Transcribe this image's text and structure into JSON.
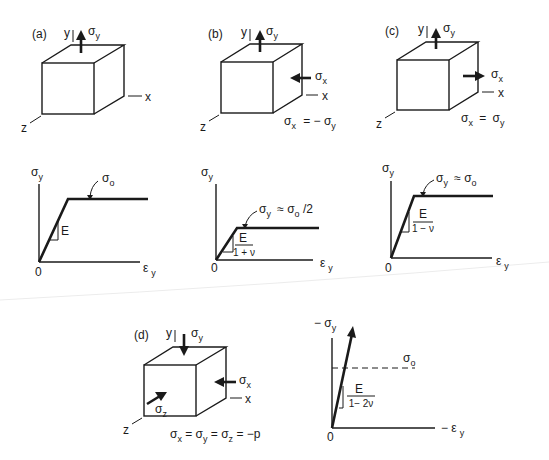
{
  "panels": {
    "a": {
      "label": "(a)",
      "axis_y": "y",
      "axis_x": "x",
      "axis_z": "z",
      "stress_y": "σ",
      "stress_y_sub": "y",
      "graph": {
        "y_axis": "σ",
        "y_axis_sub": "y",
        "x_axis": "ε",
        "x_axis_sub": "y",
        "origin": "0",
        "slope": "E",
        "plateau": "σ",
        "plateau_sub": "o"
      }
    },
    "b": {
      "label": "(b)",
      "axis_y": "y",
      "axis_x": "x",
      "axis_z": "z",
      "stress_y": "σ",
      "stress_y_sub": "y",
      "stress_x": "σ",
      "stress_x_sub": "x",
      "condition": {
        "lhs": "σ",
        "lhs_sub": "x",
        "op": "= −",
        "rhs": "σ",
        "rhs_sub": "y"
      },
      "graph": {
        "y_axis": "σ",
        "y_axis_sub": "y",
        "x_axis": "ε",
        "x_axis_sub": "y",
        "origin": "0",
        "slope_num": "E",
        "slope_den": "1 + ν",
        "plateau": "σ",
        "plateau_sub": "y",
        "plateau_eq": "≈  σ",
        "plateau_eq_sub": "o",
        "plateau_tail": " /2"
      }
    },
    "c": {
      "label": "(c)",
      "axis_y": "y",
      "axis_x": "x",
      "axis_z": "z",
      "stress_y": "σ",
      "stress_y_sub": "y",
      "stress_x": "σ",
      "stress_x_sub": "x",
      "condition": {
        "lhs": "σ",
        "lhs_sub": "x",
        "op": "=",
        "rhs": "σ",
        "rhs_sub": "y"
      },
      "graph": {
        "y_axis": "σ",
        "y_axis_sub": "y",
        "x_axis": "ε",
        "x_axis_sub": "y",
        "origin": "0",
        "slope_num": "E",
        "slope_den": "1 − ν",
        "plateau": "σ",
        "plateau_sub": "y",
        "plateau_eq": "≈  σ",
        "plateau_eq_sub": "o"
      }
    },
    "d": {
      "label": "(d)",
      "axis_y": "y",
      "axis_x": "x",
      "axis_z": "z",
      "stress_y": "σ",
      "stress_y_sub": "y",
      "stress_x": "σ",
      "stress_x_sub": "x",
      "stress_z": "σ",
      "stress_z_sub": "z",
      "condition": {
        "s1": "σ",
        "s1_sub": "x",
        "eq1": " = ",
        "s2": "σ",
        "s2_sub": "y",
        "eq2": " = ",
        "s3": "σ",
        "s3_sub": "z",
        "tail": " = −p"
      },
      "graph": {
        "y_axis_prefix": "− σ",
        "y_axis_sub": "y",
        "x_axis_prefix": "− ε",
        "x_axis_sub": "y",
        "origin": "0",
        "slope_num": "E",
        "slope_den": "1− 2ν",
        "reference": "σ",
        "reference_sub": "o"
      }
    }
  }
}
